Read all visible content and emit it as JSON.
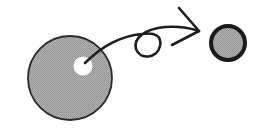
{
  "diagram": {
    "colors": {
      "background": "#ffffff",
      "disk_fill": "#a9a9a9",
      "stroke": "#1e1e1e",
      "hole": "#ffffff"
    },
    "large_disk": {
      "cx": 70,
      "cy": 78,
      "r": 42,
      "hole": {
        "cx": 83,
        "cy": 66,
        "r": 9
      }
    },
    "small_disk": {
      "cx": 228,
      "cy": 43,
      "r": 18
    },
    "arrow": {
      "from": "large-disk-hole",
      "to": "small-disk",
      "has_loop": true
    }
  }
}
